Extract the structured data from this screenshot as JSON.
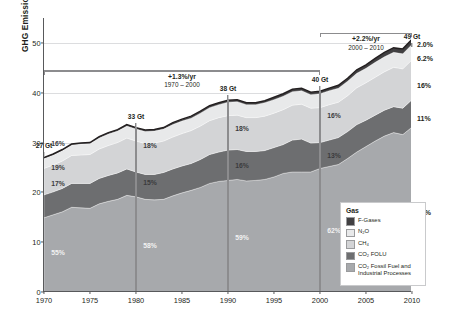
{
  "chart_data": {
    "type": "area",
    "title": "",
    "xlabel": "",
    "ylabel": "GHG Emissions [GtCO₂eq/yr]",
    "xlim": [
      1970,
      2010
    ],
    "ylim": [
      0,
      55
    ],
    "yticks": [
      0,
      10,
      20,
      30,
      40,
      50
    ],
    "xticks": [
      1970,
      1975,
      1980,
      1985,
      1990,
      1995,
      2000,
      2005,
      2010
    ],
    "grid": "horizontal",
    "stacked": true,
    "legend_position": "inside-bottom-right",
    "x": [
      1970,
      1971,
      1972,
      1973,
      1974,
      1975,
      1976,
      1977,
      1978,
      1979,
      1980,
      1981,
      1982,
      1983,
      1984,
      1985,
      1986,
      1987,
      1988,
      1989,
      1990,
      1991,
      1992,
      1993,
      1994,
      1995,
      1996,
      1997,
      1998,
      1999,
      2000,
      2001,
      2002,
      2003,
      2004,
      2005,
      2006,
      2007,
      2008,
      2009,
      2010
    ],
    "series": [
      {
        "name": "CO2 Fossil Fuel and Industrial Processes",
        "color": "#a7a9ac",
        "values": [
          14.9,
          15.5,
          16.1,
          17.0,
          16.9,
          16.8,
          17.7,
          18.2,
          18.6,
          19.4,
          19.1,
          18.6,
          18.5,
          18.6,
          19.3,
          19.9,
          20.4,
          21.0,
          21.8,
          22.2,
          22.4,
          22.6,
          22.3,
          22.4,
          22.6,
          23.1,
          23.8,
          24.1,
          24.1,
          24.1,
          24.8,
          25.2,
          25.6,
          26.8,
          28.1,
          29.2,
          30.3,
          31.3,
          32.0,
          31.6,
          33.1
        ]
      },
      {
        "name": "CO2 FOLU",
        "color": "#6d6e70",
        "values": [
          4.6,
          4.6,
          4.7,
          4.8,
          4.9,
          5.0,
          5.1,
          5.2,
          5.3,
          5.3,
          5.0,
          5.0,
          5.1,
          5.4,
          5.4,
          5.4,
          5.4,
          5.6,
          5.8,
          5.9,
          6.1,
          6.0,
          5.9,
          5.8,
          5.8,
          5.9,
          5.8,
          6.4,
          6.6,
          5.8,
          5.2,
          5.3,
          5.4,
          5.4,
          5.5,
          5.3,
          5.2,
          5.2,
          5.2,
          5.3,
          5.5
        ]
      },
      {
        "name": "CH4",
        "color": "#d3d4d6",
        "values": [
          5.3,
          5.4,
          5.5,
          5.6,
          5.7,
          5.8,
          5.9,
          6.0,
          6.1,
          6.2,
          6.2,
          6.2,
          6.3,
          6.3,
          6.4,
          6.5,
          6.6,
          6.7,
          6.8,
          6.9,
          6.9,
          6.9,
          6.8,
          6.8,
          6.9,
          6.9,
          7.0,
          7.0,
          7.0,
          7.0,
          7.0,
          7.1,
          7.1,
          7.2,
          7.4,
          7.5,
          7.6,
          7.7,
          7.9,
          7.9,
          8.0
        ]
      },
      {
        "name": "N2O",
        "color": "#e8e9ea",
        "values": [
          2.0,
          2.0,
          2.1,
          2.1,
          2.2,
          2.2,
          2.2,
          2.3,
          2.3,
          2.4,
          2.4,
          2.4,
          2.4,
          2.4,
          2.5,
          2.5,
          2.5,
          2.6,
          2.6,
          2.6,
          2.7,
          2.7,
          2.6,
          2.6,
          2.7,
          2.7,
          2.7,
          2.7,
          2.7,
          2.7,
          2.8,
          2.8,
          2.8,
          2.9,
          2.9,
          2.9,
          3.0,
          3.0,
          3.0,
          3.0,
          3.1
        ]
      },
      {
        "name": "F-Gases",
        "color": "#414042",
        "values": [
          0.2,
          0.2,
          0.2,
          0.2,
          0.2,
          0.2,
          0.3,
          0.3,
          0.3,
          0.3,
          0.3,
          0.3,
          0.3,
          0.3,
          0.4,
          0.4,
          0.4,
          0.4,
          0.4,
          0.4,
          0.4,
          0.4,
          0.4,
          0.4,
          0.4,
          0.5,
          0.5,
          0.5,
          0.5,
          0.5,
          0.5,
          0.5,
          0.6,
          0.6,
          0.7,
          0.7,
          0.8,
          0.9,
          0.9,
          1.0,
          1.0
        ]
      }
    ],
    "totals": [
      27.0,
      27.7,
      28.6,
      29.7,
      29.9,
      30.0,
      31.2,
      32.0,
      32.6,
      33.6,
      33.0,
      32.5,
      32.6,
      32.9,
      33.9,
      34.7,
      35.3,
      36.3,
      37.4,
      38.0,
      38.5,
      38.6,
      38.0,
      38.0,
      38.4,
      39.1,
      39.8,
      40.7,
      40.9,
      40.1,
      40.3,
      40.9,
      41.5,
      42.9,
      44.6,
      45.6,
      46.9,
      48.1,
      49.0,
      48.8,
      50.7
    ],
    "milestones": [
      {
        "year": 1970,
        "label": "27 Gt",
        "value": 27.0
      },
      {
        "year": 1980,
        "label": "33 Gt",
        "value": 33.0
      },
      {
        "year": 1990,
        "label": "38 Gt",
        "value": 38.5
      },
      {
        "year": 2000,
        "label": "40 Gt",
        "value": 40.3
      },
      {
        "year": 2010,
        "label": "49 Gt",
        "value": 49.0
      }
    ],
    "annotations": [
      {
        "rate": "+1.3%/yr",
        "span": "1970 – 2000",
        "from": 1970,
        "to": 2000,
        "y": 44.5
      },
      {
        "rate": "+2.2%/yr",
        "span": "2000 – 2010",
        "from": 2000,
        "to": 2010,
        "y": 52.0
      }
    ],
    "share_labels": {
      "1970": [
        {
          "series": "CH4",
          "text": "16%",
          "value": 30.0
        },
        {
          "series": "CO2FOLU",
          "text": "17%",
          "value": 21.8
        },
        {
          "series": "CO2FF",
          "text": "55%",
          "value": 8.0
        },
        {
          "series": "N2O",
          "text": "19%",
          "value": 25.0
        }
      ],
      "1980": [
        {
          "series": "CH4",
          "text": "18%",
          "value": 29.5
        },
        {
          "series": "CO2FOLU",
          "text": "15%",
          "value": 22.0
        },
        {
          "series": "CO2FF",
          "text": "58%",
          "value": 9.5
        }
      ],
      "1990": [
        {
          "series": "CH4",
          "text": "18%",
          "value": 33.0
        },
        {
          "series": "CO2FOLU",
          "text": "16%",
          "value": 25.5
        },
        {
          "series": "CO2FF",
          "text": "59%",
          "value": 11.0
        }
      ],
      "2000": [
        {
          "series": "CH4",
          "text": "16%",
          "value": 35.5
        },
        {
          "series": "CO2FOLU",
          "text": "13%",
          "value": 27.5
        },
        {
          "series": "CO2FF",
          "text": "62%",
          "value": 12.5
        }
      ]
    },
    "right_shares": [
      {
        "text": "2.0%",
        "value": 49.8
      },
      {
        "text": "6.2%",
        "value": 47.0
      },
      {
        "text": "16%",
        "value": 41.5
      },
      {
        "text": "11%",
        "value": 35.0
      },
      {
        "text": "65%",
        "value": 16.0
      }
    ]
  },
  "legend": {
    "title": "Gas",
    "items": [
      {
        "label": "F-Gases",
        "color": "#414042"
      },
      {
        "label": "N₂O",
        "color": "#e8e9ea"
      },
      {
        "label": "CH₄",
        "color": "#d3d4d6"
      },
      {
        "label": "CO₂ FOLU",
        "color": "#6d6e70"
      },
      {
        "label": "CO₂ Fossil Fuel and Industrial Processes",
        "color": "#a7a9ac"
      }
    ]
  }
}
